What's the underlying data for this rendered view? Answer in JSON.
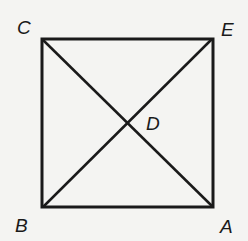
{
  "diagram": {
    "type": "square-with-diagonals",
    "points": {
      "C": {
        "label": "C",
        "x": 42,
        "y": 39
      },
      "E": {
        "label": "E",
        "x": 212,
        "y": 39
      },
      "B": {
        "label": "B",
        "x": 43,
        "y": 207
      },
      "A": {
        "label": "A",
        "x": 213,
        "y": 207
      },
      "D": {
        "label": "D",
        "x": 127,
        "y": 123
      }
    },
    "segments": [
      "CE",
      "EA",
      "AB",
      "BC",
      "CA",
      "BE"
    ],
    "labels": {
      "C": "C",
      "E": "E",
      "D": "D",
      "B": "B",
      "A": "A"
    },
    "colors": {
      "stroke": "#1a1a1a",
      "background": "#f4f4f2"
    }
  }
}
